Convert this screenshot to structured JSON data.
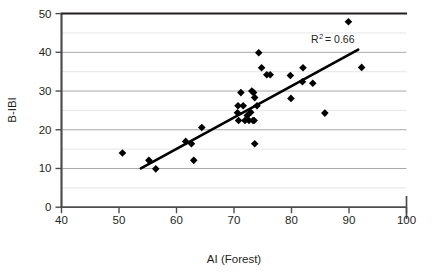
{
  "chart_data": {
    "type": "scatter",
    "title": "",
    "xlabel": "AI (Forest)",
    "ylabel": "B-IBI",
    "xlim": [
      40,
      100
    ],
    "ylim": [
      0,
      50
    ],
    "xticks": [
      40,
      50,
      60,
      70,
      80,
      90,
      100
    ],
    "yticks": [
      0,
      10,
      20,
      30,
      40,
      50
    ],
    "xtick_labels": [
      "40",
      "50",
      "60",
      "70",
      "80",
      "90",
      "100"
    ],
    "ytick_labels": [
      "0",
      "10",
      "20",
      "30",
      "40",
      "50"
    ],
    "grid": "horizontal-major-and-minor",
    "gridline_values": [
      5,
      10,
      15,
      20,
      25,
      30,
      35,
      40,
      45
    ],
    "legend": "none",
    "annotation": {
      "r_squared_label": "R",
      "r_squared_exponent": "2",
      "r_squared_value": "= 0.66",
      "full_text": "R2 = 0.66"
    },
    "marker": {
      "shape": "diamond",
      "color": "#000000",
      "size": 5
    },
    "trendline": {
      "color": "#000000",
      "width": 2.6,
      "x_start": 53.8,
      "y_start": 10.0,
      "x_end": 91.6,
      "y_end": 40.7
    },
    "points": [
      {
        "x": 50.6,
        "y": 14.0
      },
      {
        "x": 55.2,
        "y": 12.1
      },
      {
        "x": 56.4,
        "y": 9.9
      },
      {
        "x": 61.6,
        "y": 17.0
      },
      {
        "x": 62.6,
        "y": 16.4
      },
      {
        "x": 63.0,
        "y": 12.1
      },
      {
        "x": 64.4,
        "y": 20.6
      },
      {
        "x": 70.6,
        "y": 24.4
      },
      {
        "x": 70.7,
        "y": 26.2
      },
      {
        "x": 70.8,
        "y": 22.4
      },
      {
        "x": 71.2,
        "y": 29.6
      },
      {
        "x": 71.6,
        "y": 26.2
      },
      {
        "x": 71.9,
        "y": 22.4
      },
      {
        "x": 72.3,
        "y": 23.7
      },
      {
        "x": 72.6,
        "y": 22.4
      },
      {
        "x": 72.9,
        "y": 24.5
      },
      {
        "x": 73.1,
        "y": 30.0
      },
      {
        "x": 73.3,
        "y": 22.4
      },
      {
        "x": 73.4,
        "y": 29.6
      },
      {
        "x": 73.5,
        "y": 22.4
      },
      {
        "x": 73.6,
        "y": 28.3
      },
      {
        "x": 73.6,
        "y": 16.4
      },
      {
        "x": 74.0,
        "y": 26.2
      },
      {
        "x": 74.3,
        "y": 39.9
      },
      {
        "x": 74.8,
        "y": 36.0
      },
      {
        "x": 75.7,
        "y": 34.2
      },
      {
        "x": 76.3,
        "y": 34.2
      },
      {
        "x": 79.8,
        "y": 34.0
      },
      {
        "x": 79.9,
        "y": 28.1
      },
      {
        "x": 81.9,
        "y": 32.4
      },
      {
        "x": 82.0,
        "y": 36.0
      },
      {
        "x": 83.7,
        "y": 32.0
      },
      {
        "x": 85.8,
        "y": 24.3
      },
      {
        "x": 89.9,
        "y": 47.9
      },
      {
        "x": 92.2,
        "y": 36.1
      }
    ]
  },
  "axes": {
    "x_axis_name": "x-axis",
    "y_axis_name": "y-axis"
  }
}
